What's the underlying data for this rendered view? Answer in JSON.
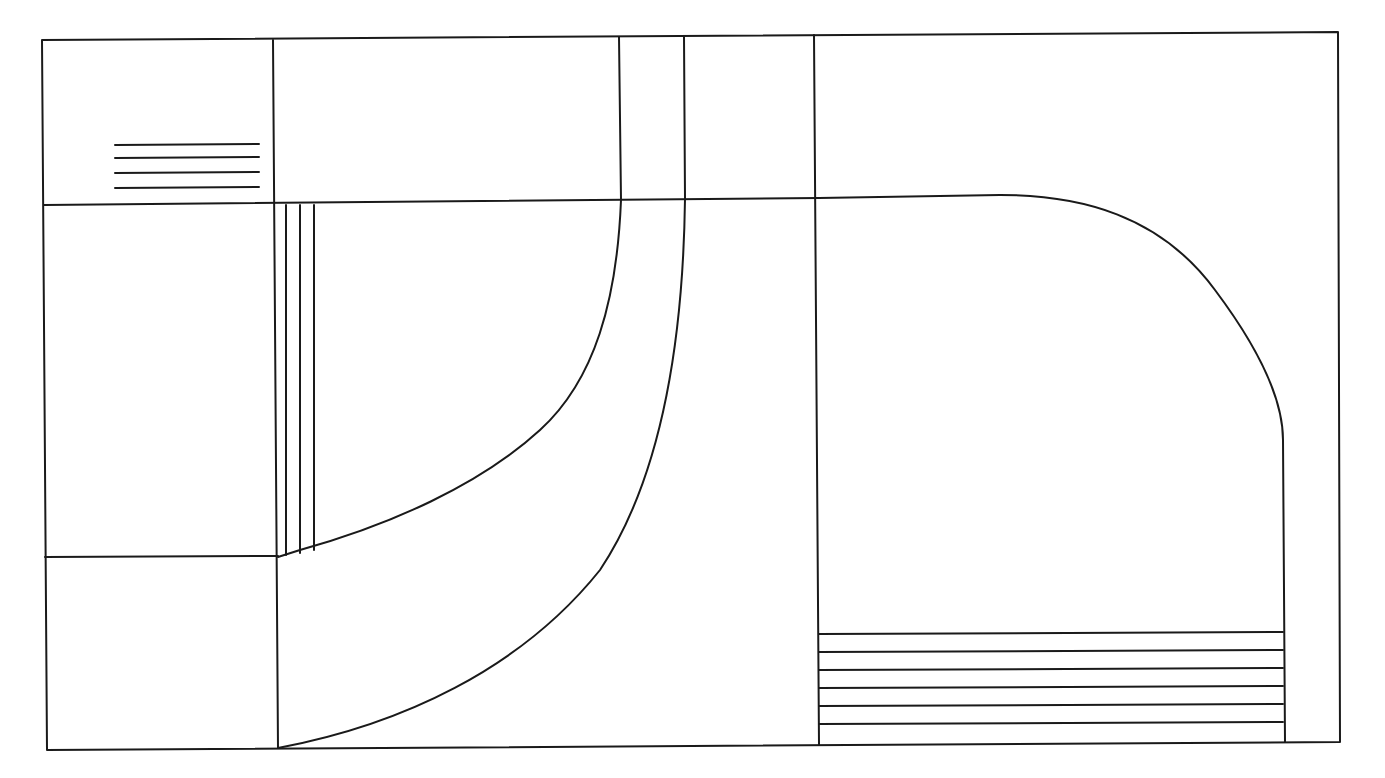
{
  "canvas": {
    "width": 1385,
    "height": 778,
    "background": "#ffffff",
    "line_color": "#1a1a1a",
    "line_width": 2
  },
  "diagram": {
    "type": "floor-plan-sketch",
    "outer_frame": {
      "points": [
        [
          42,
          40
        ],
        [
          1338,
          32
        ],
        [
          1340,
          742
        ],
        [
          47,
          750
        ]
      ]
    },
    "walls": [
      {
        "name": "vertical-wall-left",
        "points": [
          [
            273,
            40
          ],
          [
            278,
            748
          ]
        ]
      },
      {
        "name": "horizontal-wall-upper",
        "points": [
          [
            44,
            205
          ],
          [
            819,
            198
          ]
        ]
      },
      {
        "name": "horizontal-wall-lower-left",
        "points": [
          [
            45,
            557
          ],
          [
            278,
            556
          ]
        ]
      },
      {
        "name": "vertical-wall-a",
        "points": [
          [
            619,
            37
          ],
          [
            621,
            200
          ]
        ]
      },
      {
        "name": "vertical-wall-b",
        "points": [
          [
            684,
            36
          ],
          [
            685,
            199
          ]
        ]
      },
      {
        "name": "vertical-wall-center",
        "points": [
          [
            814,
            35
          ],
          [
            819,
            745
          ]
        ]
      }
    ],
    "curves": [
      {
        "name": "inner-curve",
        "d": "M621,200 C617,300 595,380 540,430 C480,485 390,525 300,550 L278,557"
      },
      {
        "name": "outer-curve",
        "d": "M685,199 C683,350 660,480 600,570 C520,670 400,725 278,748"
      },
      {
        "name": "right-curve",
        "d": "M819,198 L1000,195 C1080,195 1160,215 1215,290 C1260,350 1283,400 1283,440 L1285,742"
      }
    ],
    "stairs": [
      {
        "name": "stairs-upper-left",
        "orientation": "horizontal",
        "x1": 115,
        "x2": 259,
        "ys": [
          145,
          158,
          173,
          188
        ]
      },
      {
        "name": "stairs-vertical-strip",
        "orientation": "vertical",
        "y1": 205,
        "xs": [
          286,
          300,
          314
        ],
        "y2s": [
          555,
          553,
          550
        ]
      },
      {
        "name": "stairs-lower-right",
        "orientation": "horizontal",
        "x1": 819,
        "x2": 1283,
        "ys": [
          634,
          652,
          670,
          688,
          706,
          724
        ]
      }
    ]
  }
}
